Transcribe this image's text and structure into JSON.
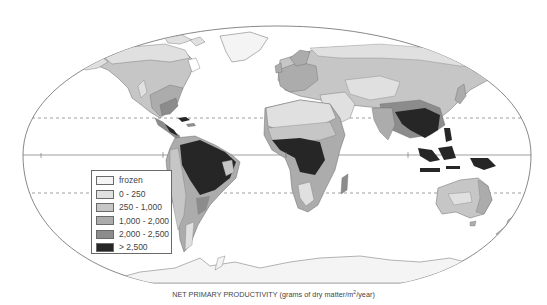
{
  "map": {
    "title": "NET PRIMARY PRODUCTIVITY",
    "units_prefix": "(grams of dry matter/m",
    "units_sup": "2",
    "units_suffix": "/year)",
    "projection": "oval world map",
    "reference_lines": [
      "Tropic of Cancer (dashed)",
      "Equator (solid)",
      "Tropic of Capricorn (dashed)"
    ]
  },
  "legend": {
    "items": [
      {
        "label": "frozen",
        "color": "#f4f4f4"
      },
      {
        "label": "0 - 250",
        "color": "#e0e0e0"
      },
      {
        "label": "250 - 1,000",
        "color": "#c6c6c6"
      },
      {
        "label": "1,000 - 2,000",
        "color": "#acacac"
      },
      {
        "label": "2,000 - 2,500",
        "color": "#8c8c8c"
      },
      {
        "label": "> 2,500",
        "color": "#262626"
      }
    ]
  },
  "colors": {
    "frozen": "#f4f4f4",
    "low": "#e0e0e0",
    "mid": "#c6c6c6",
    "high": "#acacac",
    "veryhigh": "#8c8c8c",
    "max": "#262626",
    "outline": "#6a6a6a"
  }
}
